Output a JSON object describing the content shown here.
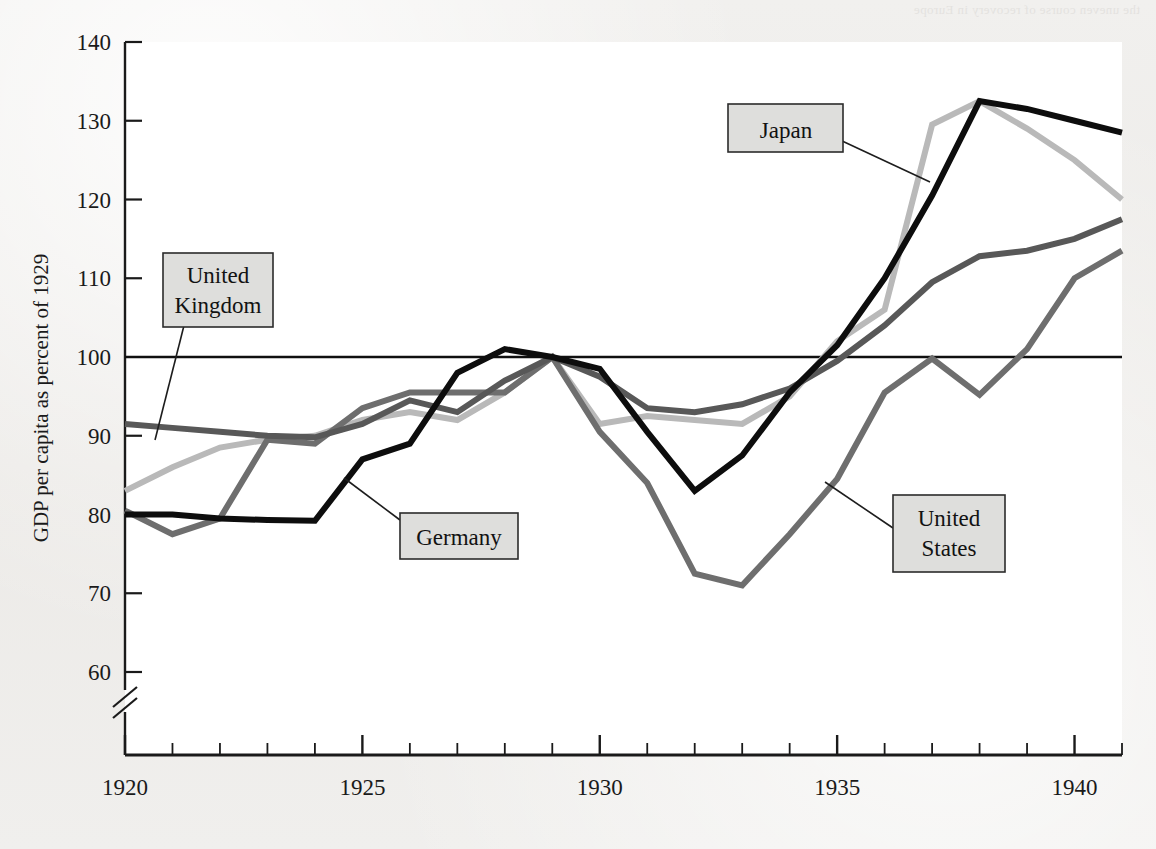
{
  "page": {
    "background_color": "#efeeec",
    "bleed_through_text": "the uneven course of recovery in Europe"
  },
  "chart_data": {
    "type": "line",
    "title": "",
    "xlabel": "",
    "ylabel": "GDP per capita as percent of 1929",
    "xlim": [
      1920,
      1941
    ],
    "ylim": [
      55,
      140
    ],
    "y_axis_break": true,
    "y_break_below": 60,
    "grid": false,
    "legend_position": "inline-callouts",
    "reference_line": {
      "value": 100,
      "label": "100"
    },
    "y_ticks": [
      60,
      70,
      80,
      90,
      100,
      110,
      120,
      130,
      140
    ],
    "x_ticks_major": [
      1920,
      1925,
      1930,
      1935,
      1940
    ],
    "x_tick_labels": [
      "1920",
      "1925",
      "1930",
      "1935",
      "1940"
    ],
    "x": [
      1920,
      1921,
      1922,
      1923,
      1924,
      1925,
      1926,
      1927,
      1928,
      1929,
      1930,
      1931,
      1932,
      1933,
      1934,
      1935,
      1936,
      1937,
      1938,
      1939,
      1940,
      1941
    ],
    "series": [
      {
        "name": "United Kingdom",
        "color": "#585858",
        "width": 6,
        "values": [
          91.5,
          91.0,
          90.5,
          90.0,
          89.8,
          91.5,
          94.5,
          93.0,
          97.0,
          100.0,
          97.5,
          93.5,
          93.0,
          94.0,
          96.0,
          99.5,
          104.0,
          109.5,
          112.8,
          113.5,
          115.0,
          117.5
        ]
      },
      {
        "name": "Germany",
        "color": "#0d0d0d",
        "width": 6,
        "values": [
          80.0,
          80.0,
          79.5,
          79.3,
          79.2,
          87.0,
          89.0,
          98.0,
          101.0,
          100.0,
          98.5,
          90.5,
          83.0,
          87.5,
          95.5,
          101.5,
          110.0,
          120.5,
          132.5,
          131.5,
          130.0,
          128.5
        ]
      },
      {
        "name": "Japan",
        "color": "#b9b9b9",
        "width": 6,
        "values": [
          83.0,
          86.0,
          88.5,
          89.5,
          90.0,
          92.0,
          93.0,
          92.0,
          95.5,
          100.0,
          91.5,
          92.5,
          92.0,
          91.5,
          95.0,
          102.0,
          106.0,
          129.5,
          132.5,
          129.0,
          125.0,
          120.0
        ]
      },
      {
        "name": "United States",
        "color": "#6e6e6e",
        "width": 6,
        "values": [
          80.5,
          77.5,
          79.5,
          89.5,
          89.0,
          93.5,
          95.5,
          95.5,
          95.5,
          100.0,
          90.5,
          84.0,
          72.5,
          71.0,
          77.5,
          84.5,
          95.5,
          99.8,
          95.2,
          101.0,
          110.0,
          113.5
        ]
      }
    ],
    "callouts": [
      {
        "label_lines": [
          "United",
          "Kingdom"
        ],
        "name": "united-kingdom"
      },
      {
        "label_lines": [
          "Germany"
        ],
        "name": "germany"
      },
      {
        "label_lines": [
          "Japan"
        ],
        "name": "japan"
      },
      {
        "label_lines": [
          "United",
          "States"
        ],
        "name": "united-states"
      }
    ]
  }
}
